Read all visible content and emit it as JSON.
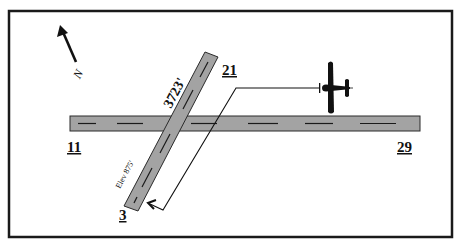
{
  "diagram": {
    "type": "airport-runway-diagram",
    "colors": {
      "frame": "#1a1a1a",
      "runway_fill": "#a3a3a3",
      "runway_edge": "#2a2a2a",
      "centerline": "#1a1a1a",
      "aircraft": "#111111",
      "path": "#111111"
    },
    "north_arrow": {
      "label": "N"
    },
    "runways": [
      {
        "id": "11-29",
        "end_a": "11",
        "end_b": "29",
        "orientation": "horizontal"
      },
      {
        "id": "3-21",
        "end_a": "3",
        "end_b": "21",
        "length_label": "3723'",
        "elevation_label": "Elev 875'",
        "orientation": "diagonal"
      }
    ],
    "aircraft": {
      "icon": "airplane-icon",
      "heading": "west",
      "path_description": "flies west, turns left onto final for runway 3, arrow points toward approach end of runway 3"
    }
  }
}
